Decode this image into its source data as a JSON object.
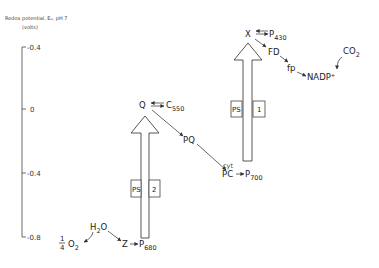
{
  "axis": {
    "title": "Redox potential, E₀, pH 7",
    "unit": "(volts)",
    "ticks": [
      "-0.4",
      "0",
      "-0.4",
      "-0.8"
    ]
  },
  "photosystems": [
    {
      "label": "PS",
      "number": "2"
    },
    {
      "label": "PS",
      "number": "1"
    }
  ],
  "species": {
    "q": "Q",
    "c550": {
      "base": "C",
      "sub": "550"
    },
    "pq": "PQ",
    "cyt": "cyt",
    "pc": "PC",
    "p700": {
      "base": "P",
      "sub": "700"
    },
    "x": "X",
    "p430": {
      "base": "P",
      "sub": "430"
    },
    "fd": "FD",
    "fp": "fp",
    "nadp": "NADP⁺",
    "co2": {
      "base": "CO",
      "sub": "2"
    },
    "h2o": {
      "base": "H",
      "sub": "2",
      "tail": "O"
    },
    "o2": {
      "frac_num": "1",
      "frac_den": "4",
      "base": "O",
      "sub": "2"
    },
    "z": "Z",
    "p680": {
      "base": "P",
      "sub": "680"
    }
  }
}
